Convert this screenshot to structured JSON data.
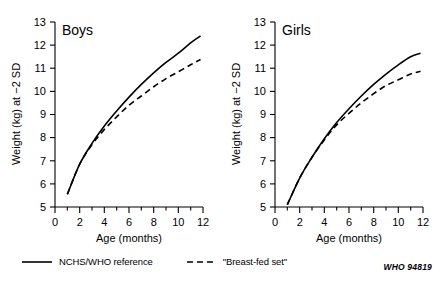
{
  "figure": {
    "source_code": "WHO 94819"
  },
  "legend": {
    "entries": [
      {
        "label": "NCHS/WHO reference",
        "style": "solid",
        "icon": "solid-line-icon"
      },
      {
        "label": "\"Breast-fed set\"",
        "style": "dashed",
        "icon": "dashed-line-icon"
      }
    ]
  },
  "chart_data": [
    {
      "type": "line",
      "title": "Boys",
      "xlabel": "Age (months)",
      "ylabel": "Weight (kg) at −2 SD",
      "xlim": [
        0,
        12
      ],
      "ylim": [
        5,
        13
      ],
      "xticks": [
        0,
        2,
        4,
        6,
        8,
        10,
        12
      ],
      "xtick_labels": [
        "0",
        "2",
        "4",
        "6",
        "8",
        "10",
        "12"
      ],
      "xminor_ticks": [
        1,
        3,
        5,
        7,
        9,
        11
      ],
      "yticks": [
        5,
        6,
        7,
        8,
        9,
        10,
        11,
        12,
        13
      ],
      "ytick_labels": [
        "5",
        "6",
        "7",
        "8",
        "9",
        "10",
        "11",
        "12",
        "13"
      ],
      "grid": false,
      "legend_position": "below-figure",
      "x": [
        1,
        2,
        3,
        4,
        5,
        6,
        7,
        8,
        9,
        10,
        11,
        11.8
      ],
      "series": [
        {
          "name": "NCHS/WHO reference",
          "style": "solid",
          "values": [
            5.55,
            6.85,
            7.75,
            8.5,
            9.15,
            9.75,
            10.3,
            10.8,
            11.25,
            11.65,
            12.1,
            12.4
          ]
        },
        {
          "name": "\"Breast-fed set\"",
          "style": "dashed",
          "values": [
            5.55,
            6.85,
            7.7,
            8.35,
            8.9,
            9.4,
            9.8,
            10.2,
            10.55,
            10.85,
            11.15,
            11.38
          ]
        }
      ]
    },
    {
      "type": "line",
      "title": "Girls",
      "xlabel": "Age (months)",
      "ylabel": "Weight (kg) at −2 SD",
      "xlim": [
        0,
        12
      ],
      "ylim": [
        5,
        13
      ],
      "xticks": [
        0,
        2,
        4,
        6,
        8,
        10,
        12
      ],
      "xtick_labels": [
        "0",
        "2",
        "4",
        "6",
        "8",
        "10",
        "12"
      ],
      "xminor_ticks": [
        1,
        3,
        5,
        7,
        9,
        11
      ],
      "yticks": [
        5,
        6,
        7,
        8,
        9,
        10,
        11,
        12,
        13
      ],
      "ytick_labels": [
        "5",
        "6",
        "7",
        "8",
        "9",
        "10",
        "11",
        "12",
        "13"
      ],
      "grid": false,
      "legend_position": "below-figure",
      "x": [
        1,
        2,
        3,
        4,
        5,
        6,
        7,
        8,
        9,
        10,
        11,
        11.8
      ],
      "series": [
        {
          "name": "NCHS/WHO reference",
          "style": "solid",
          "values": [
            5.1,
            6.25,
            7.15,
            7.95,
            8.65,
            9.25,
            9.8,
            10.3,
            10.75,
            11.15,
            11.5,
            11.65
          ]
        },
        {
          "name": "\"Breast-fed set\"",
          "style": "dashed",
          "values": [
            5.1,
            6.25,
            7.15,
            7.9,
            8.55,
            9.05,
            9.5,
            9.9,
            10.25,
            10.5,
            10.75,
            10.87
          ]
        }
      ]
    }
  ]
}
